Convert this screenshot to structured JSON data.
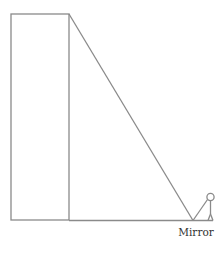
{
  "diagram": {
    "type": "similar-triangles-mirror-height",
    "labels": {
      "mirror": "Mirror"
    },
    "elements": {
      "building": {
        "x": 11,
        "y": 14,
        "width": 58,
        "height": 206
      },
      "ground": {
        "x1": 69,
        "y1": 220.5,
        "x2": 213,
        "y2": 220.5
      },
      "ray_to_top": {
        "x1": 69,
        "y1": 14,
        "x2": 193,
        "y2": 220
      },
      "ray_to_eye": {
        "x1": 193,
        "y1": 220,
        "x2": 207,
        "y2": 200
      },
      "person": {
        "head_cx": 210,
        "head_cy": 197,
        "head_r": 3.5
      }
    },
    "colors": {
      "line": "#8a8a8a",
      "text": "#333333"
    }
  }
}
